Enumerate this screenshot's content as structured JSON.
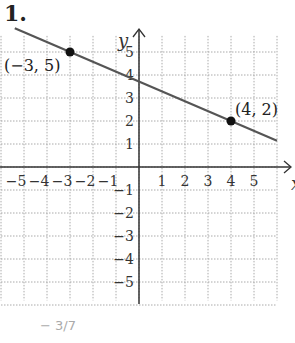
{
  "problem": {
    "number": "1."
  },
  "chart_data": {
    "type": "line",
    "title": "",
    "xlabel": "x",
    "ylabel": "y",
    "xlim": [
      -6,
      6
    ],
    "ylim": [
      -6,
      6
    ],
    "grid": true,
    "x_ticks": [
      -5,
      -4,
      -3,
      -2,
      -1,
      1,
      2,
      3,
      4,
      5
    ],
    "y_ticks": [
      -5,
      -4,
      -3,
      -2,
      -1,
      1,
      2,
      3,
      4,
      5
    ],
    "x_tick_labels": [
      "−5",
      "−4",
      "−3",
      "−2",
      "−1",
      "1",
      "2",
      "3",
      "4",
      "5"
    ],
    "y_tick_labels": [
      "5",
      "4",
      "3",
      "2",
      "1",
      "−1",
      "−2",
      "−3",
      "−4",
      "−5"
    ],
    "series": [
      {
        "name": "line",
        "points": [
          {
            "x": -3,
            "y": 5,
            "label": "(−3, 5)"
          },
          {
            "x": 4,
            "y": 2,
            "label": "(4, 2)"
          }
        ],
        "slope": "-3/7"
      }
    ],
    "annotations": [
      "(−3, 5)",
      "(4, 2)"
    ]
  },
  "footer": {
    "answer_hint": "− 3/7"
  },
  "colors": {
    "line": "#555555",
    "axis": "#333333",
    "grid": "#aaaaaa",
    "point": "#111111"
  }
}
